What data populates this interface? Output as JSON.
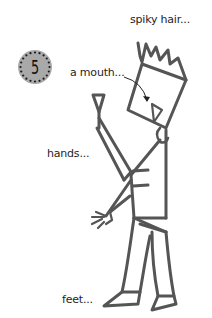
{
  "step": {
    "number": "5",
    "badge_fill": "#a9a9a9",
    "dot_color": "#1a1a1a"
  },
  "labels": {
    "hair": "spiky hair...",
    "mouth": "a mouth...",
    "hands": "hands...",
    "feet": "feet..."
  },
  "colors": {
    "line": "#555555",
    "background": "#ffffff",
    "arrow": "#222222"
  },
  "icons": {
    "mouth_arrow": "curved-arrow-icon"
  }
}
